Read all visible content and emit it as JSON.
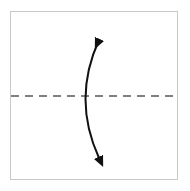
{
  "figure": {
    "title": "Curved double-headed arrow crossing a dashed horizontal axis",
    "caption": "",
    "background_color": "#ffffff",
    "panel": {
      "name": "diagram-panel",
      "x": 10,
      "y": 11,
      "width": 168,
      "height": 169,
      "fill": "#ffffff",
      "border_color": "#c9c9c9",
      "border_width": 1
    },
    "axis": {
      "name": "horizontal-dashed-axis",
      "orientation": "horizontal",
      "label": "",
      "color": "#808080",
      "stroke_width": 2,
      "dash_length": 8,
      "gap_length": 6,
      "x_start": 11,
      "x_end": 177,
      "y": 96
    },
    "arrow": {
      "name": "curved-double-arrow",
      "label": "",
      "style": "double-headed-arc",
      "color": "#111111",
      "stroke_width": 2,
      "bow_direction": "left",
      "start_point": [
        99,
        40
      ],
      "end_point": [
        99,
        158
      ],
      "control_point": [
        72,
        99
      ],
      "crosses_axis": true,
      "head_top": {
        "name": "arrowhead-top",
        "tip": [
          100,
          36
        ],
        "direction": "up-right",
        "length": 13,
        "width": 11
      },
      "head_bottom": {
        "name": "arrowhead-bottom",
        "tip": [
          101,
          162
        ],
        "direction": "down-right",
        "length": 13,
        "width": 11
      }
    }
  }
}
